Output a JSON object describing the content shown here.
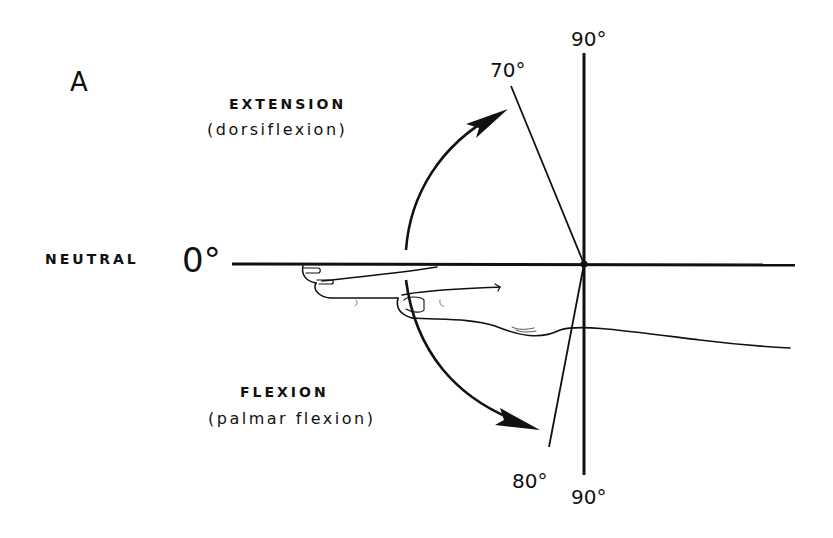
{
  "figure": {
    "panel_label": "A",
    "neutral": {
      "label": "NEUTRAL",
      "angle": "0°"
    },
    "extension": {
      "label": "EXTENSION",
      "sublabel": "(dorsiflexion)",
      "angle": "70°",
      "reference": "90°"
    },
    "flexion": {
      "label": "FLEXION",
      "sublabel": "(palmar flexion)",
      "angle": "80°",
      "reference": "90°"
    },
    "colors": {
      "ink": "#111111",
      "background": "#ffffff"
    }
  }
}
